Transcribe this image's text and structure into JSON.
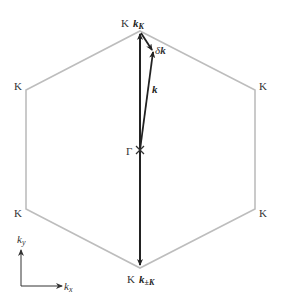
{
  "diagram": {
    "colors": {
      "hexagon": "#bdbdbd",
      "arrow": "#222222",
      "text": "#333333",
      "background": "#ffffff"
    },
    "vertices": [
      {
        "id": "top",
        "label": "K",
        "x": 140,
        "y": 31
      },
      {
        "id": "upper-right",
        "label": "K",
        "x": 255,
        "y": 90
      },
      {
        "id": "lower-right",
        "label": "K",
        "x": 255,
        "y": 209
      },
      {
        "id": "bottom",
        "label": "K",
        "x": 140,
        "y": 268
      },
      {
        "id": "lower-left",
        "label": "K",
        "x": 26,
        "y": 209
      },
      {
        "id": "upper-left",
        "label": "K",
        "x": 26,
        "y": 90
      }
    ],
    "center": {
      "label": "Γ",
      "x": 140,
      "y": 150
    },
    "vectors": {
      "k_K": {
        "label_main": "k",
        "label_sub": "K"
      },
      "k_negK": {
        "label_main": "k",
        "label_sub": "±K"
      },
      "k": {
        "label_main": "k"
      },
      "delta_k": {
        "label_prefix": "δ",
        "label_main": "k"
      }
    },
    "axes": {
      "x_label_main": "k",
      "x_label_sub": "x",
      "y_label_main": "k",
      "y_label_sub": "y"
    },
    "labels": {
      "K_top": "K",
      "K_upper_right": "K",
      "K_lower_right": "K",
      "K_bottom": "K",
      "K_lower_left": "K",
      "K_upper_left": "K",
      "gamma": "Γ"
    }
  }
}
